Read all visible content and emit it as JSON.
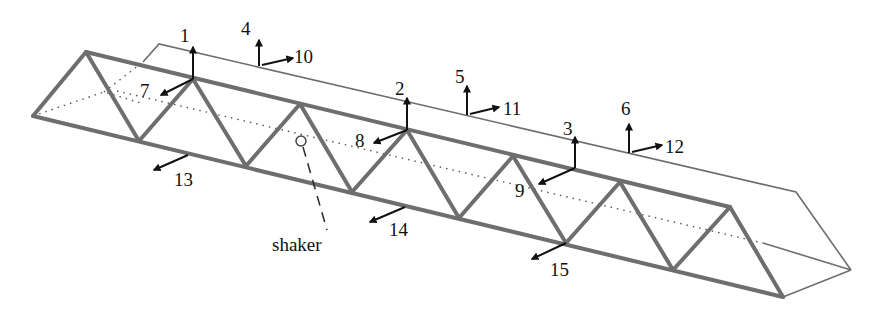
{
  "diagram": {
    "colors": {
      "truss": "#6e6e6e",
      "arrows": "#111111",
      "outline": "#6e6e6e",
      "hidden": "#555555"
    },
    "measurement_points": [
      {
        "id": "1",
        "direction": "vertical"
      },
      {
        "id": "2",
        "direction": "vertical"
      },
      {
        "id": "3",
        "direction": "vertical"
      },
      {
        "id": "4",
        "direction": "vertical"
      },
      {
        "id": "5",
        "direction": "vertical"
      },
      {
        "id": "6",
        "direction": "vertical"
      },
      {
        "id": "7",
        "direction": "lateral"
      },
      {
        "id": "8",
        "direction": "lateral"
      },
      {
        "id": "9",
        "direction": "lateral"
      },
      {
        "id": "10",
        "direction": "lateral"
      },
      {
        "id": "11",
        "direction": "lateral"
      },
      {
        "id": "12",
        "direction": "lateral"
      },
      {
        "id": "13",
        "direction": "lateral"
      },
      {
        "id": "14",
        "direction": "lateral"
      },
      {
        "id": "15",
        "direction": "lateral"
      }
    ],
    "labels": {
      "l1": "1",
      "l2": "2",
      "l3": "3",
      "l4": "4",
      "l5": "5",
      "l6": "6",
      "l7": "7",
      "l8": "8",
      "l9": "9",
      "l10": "10",
      "l11": "11",
      "l12": "12",
      "l13": "13",
      "l14": "14",
      "l15": "15",
      "shaker": "shaker"
    }
  }
}
